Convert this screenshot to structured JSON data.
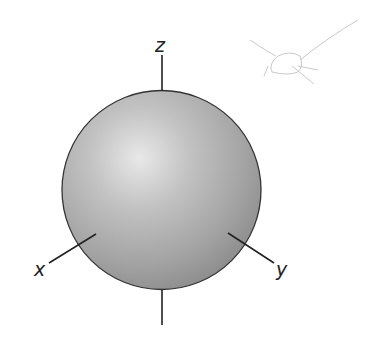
{
  "diagram": {
    "sphere": {
      "center": [
        161,
        190
      ],
      "radius": 99,
      "highlight": [
        138,
        158
      ],
      "colors": {
        "highlight": "#e6e6e6",
        "mid": "#b4b4b4",
        "shade": "#8c8c8c",
        "outline": "#333333"
      }
    },
    "axes": [
      {
        "name": "z",
        "label": "z",
        "from": [
          162,
          55
        ],
        "to": [
          162,
          91
        ]
      },
      {
        "name": "z-neg",
        "label": "",
        "from": [
          162,
          290
        ],
        "to": [
          162,
          325
        ]
      },
      {
        "name": "x",
        "label": "x",
        "from": [
          95,
          235
        ],
        "to": [
          49,
          263
        ]
      },
      {
        "name": "y",
        "label": "y",
        "from": [
          229,
          234
        ],
        "to": [
          273,
          262
        ]
      }
    ],
    "labels": {
      "z": "z",
      "x": "x",
      "y": "y"
    },
    "sketch_mark": {
      "description": "faint pencil doodle",
      "color": "#c8c8c8"
    }
  }
}
